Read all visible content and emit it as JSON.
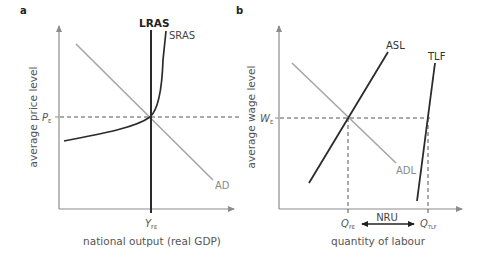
{
  "panel_a": {
    "label": "a",
    "y_axis_label": "average price level",
    "x_axis_label": "national output (real GDP)",
    "curves": {
      "lras": "LRAS",
      "sras": "SRAS",
      "ad": "AD"
    },
    "equilibrium": {
      "price_main": "P",
      "price_sub": "E",
      "output_main": "Y",
      "output_sub": "FE"
    }
  },
  "panel_b": {
    "label": "b",
    "y_axis_label": "average wage level",
    "x_axis_label": "quantity of labour",
    "curves": {
      "asl": "ASL",
      "adl": "ADL",
      "tlf": "TLF"
    },
    "equilibrium": {
      "wage_main": "W",
      "wage_sub": "E",
      "qfe_main": "Q",
      "qfe_sub": "FE",
      "qtlf_main": "Q",
      "qtlf_sub": "TLF"
    },
    "gap_label": "NRU"
  },
  "colors": {
    "dark_line": "#2b2b2b",
    "light_line": "#a6a6a6",
    "axis": "#8c8c8c",
    "dashed": "#555555",
    "text_dark": "#222222",
    "text_grey": "#8a8a8a"
  }
}
